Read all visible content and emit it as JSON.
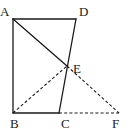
{
  "diagram": {
    "type": "geometry",
    "points": {
      "A": {
        "label": "A",
        "x": 13,
        "y": 19,
        "lx": 0,
        "ly": 16
      },
      "D": {
        "label": "D",
        "x": 76,
        "y": 19,
        "lx": 79,
        "ly": 16
      },
      "B": {
        "label": "B",
        "x": 13,
        "y": 113,
        "lx": 10,
        "ly": 128
      },
      "C": {
        "label": "C",
        "x": 59,
        "y": 113,
        "lx": 61,
        "ly": 128
      },
      "E": {
        "label": "E",
        "x": 67,
        "y": 66,
        "lx": 73,
        "ly": 73
      },
      "F": {
        "label": "F",
        "x": 119,
        "y": 113,
        "lx": 112,
        "ly": 128
      }
    },
    "solid_segments": [
      [
        "A",
        "D"
      ],
      [
        "A",
        "B"
      ],
      [
        "B",
        "C"
      ],
      [
        "C",
        "D"
      ],
      [
        "A",
        "E"
      ]
    ],
    "dashed_segments": [
      [
        "B",
        "E"
      ],
      [
        "E",
        "F"
      ],
      [
        "C",
        "F"
      ]
    ]
  }
}
